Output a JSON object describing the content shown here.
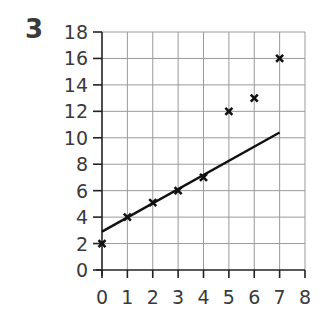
{
  "question_number": "3",
  "chart_data": {
    "type": "scatter",
    "title": "",
    "xlabel": "",
    "ylabel": "",
    "xlim": [
      0,
      8
    ],
    "ylim": [
      0,
      18
    ],
    "grid": true,
    "x_ticks": [
      "0",
      "1",
      "2",
      "3",
      "4",
      "5",
      "6",
      "7",
      "8"
    ],
    "y_ticks": [
      "0",
      "2",
      "4",
      "6",
      "8",
      "10",
      "12",
      "14",
      "16",
      "18"
    ],
    "series": [
      {
        "name": "points",
        "marker": "x",
        "x": [
          0,
          1,
          2,
          3,
          4,
          5,
          6,
          7
        ],
        "y": [
          2,
          4,
          5.1,
          6,
          7,
          12,
          13,
          16
        ]
      }
    ],
    "line_of_best_fit": {
      "x": [
        0,
        7
      ],
      "y": [
        2.9,
        10.4
      ]
    }
  }
}
